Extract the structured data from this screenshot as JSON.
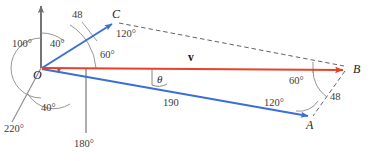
{
  "figure": {
    "colors": {
      "axis": "#6e6e6e",
      "vector_blue": "#3b6fd4",
      "vector_red": "#e8402a",
      "dashed": "#5a5a5a",
      "arc": "#6e6e6e",
      "text": "#1a1a1a"
    },
    "points": [
      {
        "id": "O",
        "label": "O",
        "x": 41,
        "y": 68
      },
      {
        "id": "C",
        "label": "C",
        "x": 113,
        "y": 22
      },
      {
        "id": "B",
        "label": "B",
        "x": 345,
        "y": 70
      },
      {
        "id": "A",
        "label": "A",
        "x": 310,
        "y": 118
      }
    ],
    "axis_labels": [
      {
        "name": "bearing-180",
        "text": "180°",
        "x": 74,
        "y": 144
      },
      {
        "name": "bearing-220",
        "text": "220°",
        "x": 4,
        "y": 129
      }
    ],
    "angle_labels": [
      {
        "name": "angle-100-at-origin",
        "text": "100°",
        "x": 32,
        "y": 42
      },
      {
        "name": "angle-40-upper",
        "text": "40°",
        "x": 71,
        "y": 41
      },
      {
        "name": "angle-120-at-c",
        "text": "120°",
        "x": 118,
        "y": 33
      },
      {
        "name": "angle-60-at-origin",
        "text": "60°",
        "x": 103,
        "y": 54
      },
      {
        "name": "angle-40-lower",
        "text": "40°",
        "x": 51,
        "y": 112
      },
      {
        "name": "angle-60-at-b",
        "text": "60°",
        "x": 303,
        "y": 79
      },
      {
        "name": "angle-120-at-a",
        "text": "120°",
        "x": 277,
        "y": 101
      }
    ],
    "magnitude_labels": [
      {
        "name": "magnitude-48-oc",
        "text": "48",
        "x": 74,
        "y": 13
      },
      {
        "name": "magnitude-190-oa",
        "text": "190",
        "x": 166,
        "y": 102
      },
      {
        "name": "magnitude-48-ba",
        "text": "48",
        "x": 331,
        "y": 97
      }
    ],
    "vector_labels": [
      {
        "name": "vector-v-label",
        "text": "v",
        "x": 190,
        "y": 57
      }
    ],
    "theta_labels": [
      {
        "name": "theta-angle-label",
        "text": "θ",
        "x": 153,
        "y": 79
      }
    ]
  }
}
